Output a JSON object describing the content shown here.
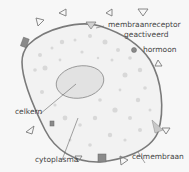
{
  "labels": {
    "receptor_line1": "membraanreceptor",
    "receptor_line2": "geactiveerd",
    "hormone": "hormoon",
    "nucleus": "celkern",
    "cytoplasm": "cytoplasma",
    "membrane": "celmembraan"
  },
  "colors": {
    "background": "#f7f7f7",
    "membrane": "#7a7a7a",
    "cytoplasm_fill": "#f2f2f2",
    "granules": "#d6d6d6",
    "nucleus_fill": "#e2e2e2",
    "text": "#444444"
  }
}
